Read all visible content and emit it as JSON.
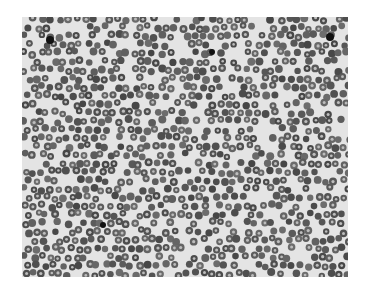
{
  "image": {
    "subject": "grayscale microscopy of densely packed red blood cells (blood smear)",
    "background": "#ffffff",
    "field_color": "#e4e4e4",
    "cell_color": "#5a5a5a",
    "cell_center_color": "#bdbdbd",
    "frame": {
      "x": 22,
      "y": 17,
      "width": 326,
      "height": 260
    },
    "dark_spots": [
      {
        "x": 50,
        "y": 40,
        "r": 4
      },
      {
        "x": 212,
        "y": 52,
        "r": 3
      },
      {
        "x": 330,
        "y": 37,
        "r": 4
      },
      {
        "x": 103,
        "y": 225,
        "r": 3
      }
    ]
  }
}
